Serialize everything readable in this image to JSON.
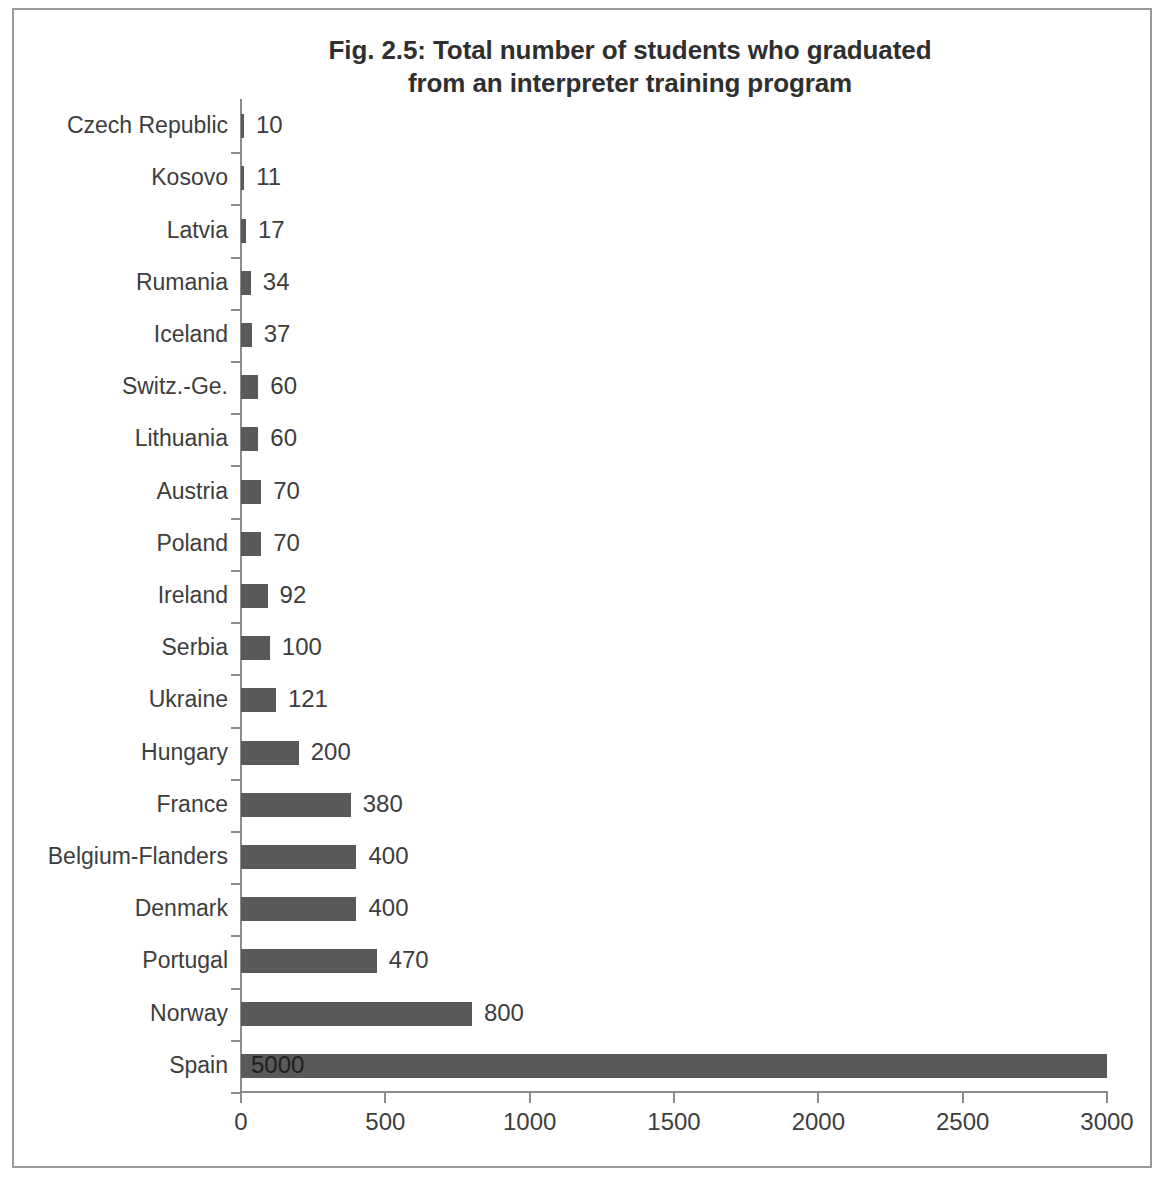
{
  "chart_data": {
    "type": "bar",
    "orientation": "horizontal",
    "title": "Fig. 2.5: Total number of students who graduated from an interpreter training program",
    "title_lines": [
      "Fig. 2.5: Total number of students who graduated",
      "from an interpreter training program"
    ],
    "xlabel": "",
    "ylabel": "",
    "xlim": [
      0,
      3000
    ],
    "xticks": [
      0,
      500,
      1000,
      1500,
      2000,
      2500,
      3000
    ],
    "xtick_labels": [
      "0",
      "500",
      "1000",
      "1500",
      "2000",
      "2500",
      "3000"
    ],
    "grid": false,
    "legend": false,
    "bar_color": "#595959",
    "axis_color": "#8c8c8c",
    "note": "Spain's bar value of 5000 exceeds the axis maximum of 3000 and is drawn clipped at the plot edge; its data label is printed inside the bar.",
    "categories": [
      "Czech Republic",
      "Kosovo",
      "Latvia",
      "Rumania",
      "Iceland",
      "Switz.-Ge.",
      "Lithuania",
      "Austria",
      "Poland",
      "Ireland",
      "Serbia",
      "Ukraine",
      "Hungary",
      "France",
      "Belgium-Flanders",
      "Denmark",
      "Portugal",
      "Norway",
      "Spain"
    ],
    "values": [
      10,
      11,
      17,
      34,
      37,
      60,
      60,
      70,
      70,
      92,
      100,
      121,
      200,
      380,
      400,
      400,
      470,
      800,
      5000
    ],
    "value_labels": [
      "10",
      "11",
      "17",
      "34",
      "37",
      "60",
      "60",
      "70",
      "70",
      "92",
      "100",
      "121",
      "200",
      "380",
      "400",
      "400",
      "470",
      "800",
      "5000"
    ]
  }
}
